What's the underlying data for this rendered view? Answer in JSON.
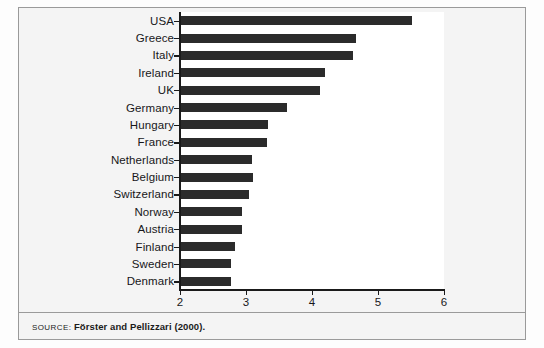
{
  "figure": {
    "source_label": "SOURCE:",
    "source_text": "Förster and Pellizzari (2000)."
  },
  "chart_data": {
    "type": "bar",
    "orientation": "horizontal",
    "title": "",
    "subtitle": "",
    "xlabel": "",
    "ylabel": "",
    "xlim": [
      2,
      6
    ],
    "xticks": [
      2,
      3,
      4,
      5,
      6
    ],
    "xtick_labels": [
      "2",
      "3",
      "4",
      "5",
      "6"
    ],
    "grid": false,
    "legend": null,
    "bar_color": "#2b2b2b",
    "plot_background": "#ffffff",
    "figure_background": "#f4f4f4",
    "categories": [
      "USA",
      "Greece",
      "Italy",
      "Ireland",
      "UK",
      "Germany",
      "Hungary",
      "France",
      "Netherlands",
      "Belgium",
      "Switzerland",
      "Norway",
      "Austria",
      "Finland",
      "Sweden",
      "Denmark"
    ],
    "values": [
      5.52,
      4.67,
      4.62,
      4.2,
      4.12,
      3.62,
      3.33,
      3.32,
      3.09,
      3.11,
      3.05,
      2.94,
      2.94,
      2.83,
      2.77,
      2.77
    ]
  }
}
